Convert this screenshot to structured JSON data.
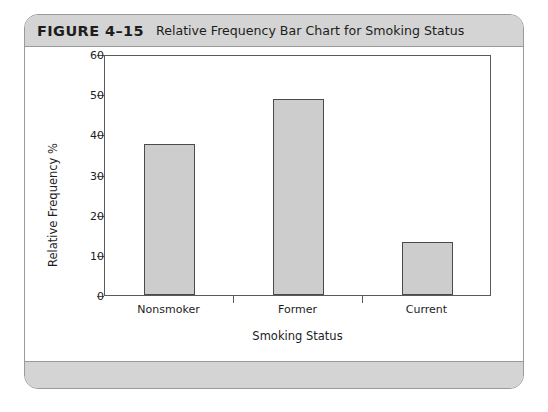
{
  "figure": {
    "number": "FIGURE 4–15",
    "caption": "Relative Frequency Bar Chart for Smoking Status"
  },
  "colors": {
    "bar_fill": "#cdcdcd",
    "bar_stroke": "#4a4a4a",
    "axis": "#5a5a5a",
    "header_band": "#d4d4d4",
    "card_border": "#9a9a9a"
  },
  "chart_data": {
    "type": "bar",
    "title": "Relative Frequency Bar Chart for Smoking Status",
    "categories": [
      "Nonsmoker",
      "Former",
      "Current"
    ],
    "values": [
      37.5,
      48.8,
      13.3
    ],
    "xlabel": "Smoking Status",
    "ylabel": "Relative Frequency %",
    "ylim": [
      0,
      60
    ],
    "yticks": [
      0,
      10,
      20,
      30,
      40,
      50,
      60
    ],
    "ytick_labels": [
      "0",
      "10",
      "20",
      "30",
      "40",
      "50",
      "60"
    ],
    "grid": false,
    "legend": false
  }
}
